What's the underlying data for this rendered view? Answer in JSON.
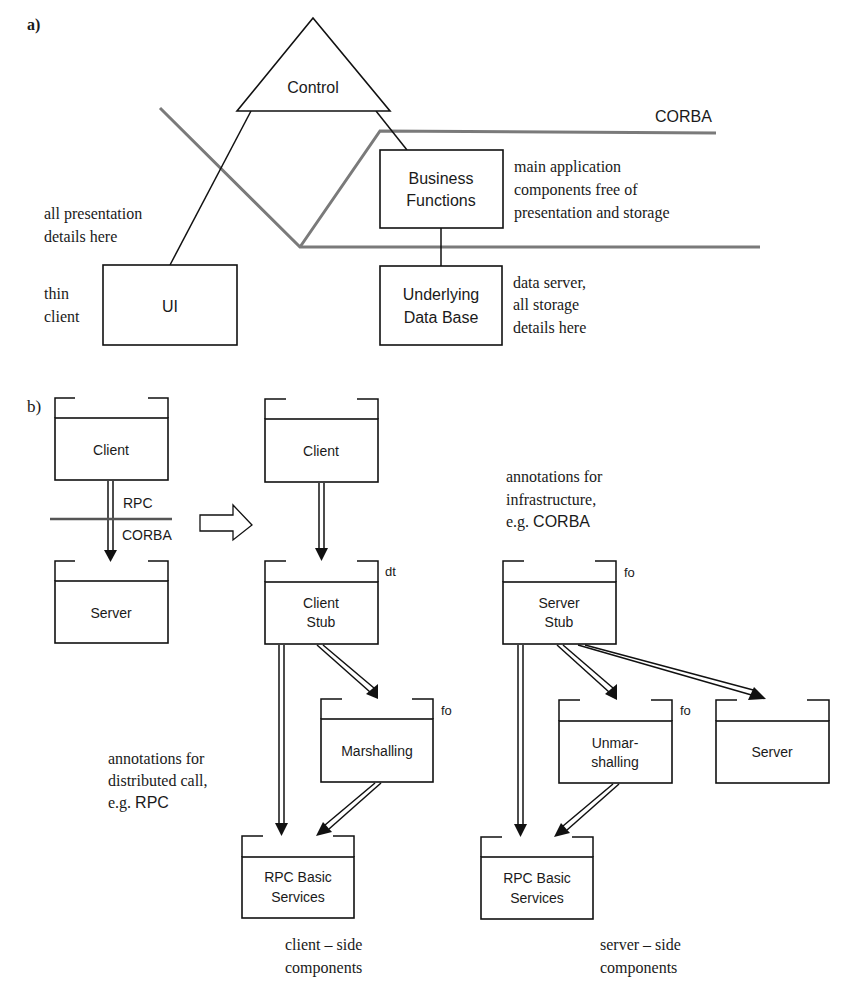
{
  "part_a": {
    "label": "a)",
    "control": "Control",
    "corba": "CORBA",
    "business": [
      "Business",
      "Functions"
    ],
    "database": [
      "Underlying",
      "Data Base"
    ],
    "ui": "UI",
    "note_main": [
      "main application",
      "components free of",
      "presentation and storage"
    ],
    "note_presentation": [
      "all presentation",
      "details here"
    ],
    "note_thin": [
      "thin",
      "client"
    ],
    "note_data": [
      "data server,",
      "all storage",
      "details here"
    ]
  },
  "part_b": {
    "label": "b)",
    "left_client": "Client",
    "left_server": "Server",
    "rpc": "RPC",
    "corba": "CORBA",
    "client": "Client",
    "client_stub": [
      "Client",
      "Stub"
    ],
    "client_stub_tag": "dt",
    "marshalling": "Marshalling",
    "marshalling_tag": "fo",
    "rpc_basic_client": [
      "RPC Basic",
      "Services"
    ],
    "server_stub": [
      "Server",
      "Stub"
    ],
    "server_stub_tag": "fo",
    "unmarshalling": [
      "Unmar-",
      "shalling"
    ],
    "unmarshalling_tag": "fo",
    "server": "Server",
    "rpc_basic_server": [
      "RPC Basic",
      "Services"
    ],
    "note_distributed": [
      "annotations for",
      "distributed call,",
      "e.g. ",
      "RPC"
    ],
    "note_infra": [
      "annotations for",
      "infrastructure,",
      "e.g. ",
      "CORBA"
    ],
    "caption_client": [
      "client – side",
      "components"
    ],
    "caption_server": [
      "server – side",
      "components"
    ]
  }
}
